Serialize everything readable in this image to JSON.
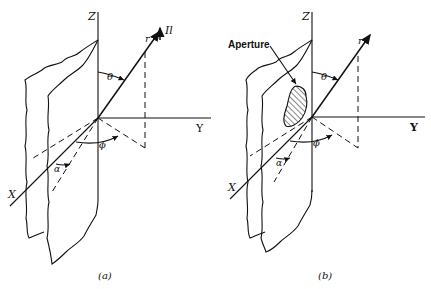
{
  "figure": {
    "panels": [
      {
        "id": "a",
        "caption": "(a)",
        "labels": {
          "z_axis": "Z",
          "y_axis": "Y",
          "x_axis": "X",
          "radius": "r",
          "source": "Il",
          "theta": "θ",
          "phi": "ϕ",
          "alpha": "α"
        }
      },
      {
        "id": "b",
        "caption": "(b)",
        "labels": {
          "z_axis": "Z",
          "y_axis": "Y",
          "x_axis": "X",
          "radius": "r",
          "theta": "θ",
          "phi": "ϕ",
          "alpha": "α",
          "aperture": "Aperture"
        }
      }
    ]
  }
}
